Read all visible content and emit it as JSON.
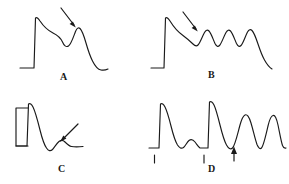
{
  "figure": {
    "type": "arterial-pressure-waveform-panels",
    "background_color": "#ffffff",
    "stroke_color": "#1a1a1a",
    "panel_count": 4,
    "panels": [
      {
        "id": "A",
        "label": "A",
        "description": "Single pressure pulse with sharp upstroke, rounded systolic peak, mid-systolic dip (notch) marked by arrow, secondary late-systolic peak, then long diastolic decay",
        "has_baseline_segment": true,
        "has_calibration_bracket": false,
        "annotation_arrow": {
          "present": true,
          "direction": "down-right",
          "points_to": "mid-systolic notch"
        },
        "tick_marks": 0,
        "beats": 1
      },
      {
        "id": "B",
        "label": "B",
        "description": "Sharp upstroke then a descending limb carrying a train of four rounded oscillations beginning at the arrow, followed by a falling diastolic tail",
        "has_baseline_segment": true,
        "has_calibration_bracket": false,
        "annotation_arrow": {
          "present": true,
          "direction": "down-right",
          "points_to": "onset of superimposed oscillations"
        },
        "tick_marks": 0,
        "beats": 1,
        "oscillation_count": 4
      },
      {
        "id": "C",
        "label": "C",
        "description": "Calibration bracket at left, tall narrow systolic spike with rapid decay to a deep trough, then a small low rounded wave marked by arrow and a flat tail",
        "has_baseline_segment": true,
        "has_calibration_bracket": true,
        "annotation_arrow": {
          "present": true,
          "direction": "down-left",
          "points_to": "small late rounded wave"
        },
        "tick_marks": 0,
        "beats": 1
      },
      {
        "id": "D",
        "label": "D",
        "description": "Two beats with sharp upstrokes and small secondary humps, followed by two tall rounded waves; upward arrow marks the trough before the tall rounded waves; two short tick marks sit below the baseline at the sharp upstrokes",
        "has_baseline_segment": true,
        "has_calibration_bracket": false,
        "annotation_arrow": {
          "present": true,
          "direction": "up",
          "points_to": "diastolic trough preceding augmented waves"
        },
        "tick_marks": 2,
        "beats": 4
      }
    ]
  }
}
